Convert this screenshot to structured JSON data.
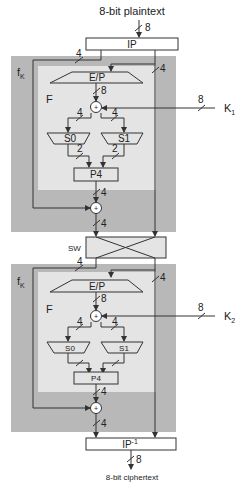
{
  "diagram": {
    "title_top": "8-bit plaintext",
    "title_bottom": "8-bit ciphertext",
    "colors": {
      "outer_box": "#b8b8b8",
      "inner_box": "#e4e4e4",
      "line": "#333333",
      "box_fill": "#ffffff"
    },
    "blocks": {
      "ip": "IP",
      "ip_inv_base": "IP",
      "ip_inv_sup": "-1",
      "sw": "SW"
    },
    "round1": {
      "fk_label": "f",
      "fk_sub": "K",
      "f_label": "F",
      "ep": "E/P",
      "s0": "S0",
      "s1": "S1",
      "p4": "P4",
      "key_label": "K",
      "key_sub": "1"
    },
    "round2": {
      "fk_label": "f",
      "fk_sub": "K",
      "f_label": "F",
      "ep": "E/P",
      "s0": "S0",
      "s1": "S1",
      "p4": "P4",
      "key_label": "K",
      "key_sub": "2"
    },
    "bit_widths": {
      "plaintext": "8",
      "ip_left": "4",
      "ip_right": "4",
      "ep_out": "8",
      "key1": "8",
      "xor_left": "4",
      "xor_right": "4",
      "s0_out": "2",
      "s1_out": "2",
      "p4_out": "4",
      "round1_out": "4",
      "sw_left": "4",
      "sw_right": "4",
      "key2": "8",
      "round2_p4_out": "4",
      "round2_out": "4",
      "ciphertext": "8"
    }
  }
}
